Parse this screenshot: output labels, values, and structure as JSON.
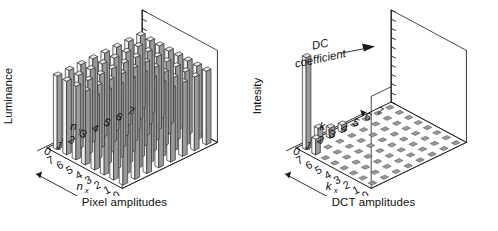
{
  "figure": {
    "title": "",
    "panels": [
      {
        "id": "pixel-amplitudes",
        "caption": "Pixel amplitudes",
        "vertical_axis_label": "Luminance",
        "x_axis_label": "n",
        "x_axis_sub": "x",
        "y_axis_label": "n",
        "y_axis_sub": "y",
        "tick_labels_y": [
          "0",
          "1",
          "2",
          "3",
          "4",
          "5",
          "6",
          "7"
        ],
        "tick_labels_x": [
          "7",
          "6",
          "5",
          "4",
          "3",
          "2",
          "1",
          "0"
        ],
        "annotation": "",
        "annotation_sub": ""
      },
      {
        "id": "dct-amplitudes",
        "caption": "DCT amplitudes",
        "vertical_axis_label": "Intesity",
        "x_axis_label": "k",
        "x_axis_sub": "x",
        "y_axis_label": "k",
        "y_axis_sub": "y",
        "tick_labels_y": [
          "0",
          "1",
          "2",
          "3",
          "4",
          "5",
          "6",
          "7"
        ],
        "tick_labels_x": [
          "7",
          "6",
          "5",
          "4",
          "3",
          "2",
          "1",
          "0"
        ],
        "annotation": "DC",
        "annotation_sub": "coefficient"
      }
    ]
  },
  "colors": {
    "background": "#ffffff",
    "ink": "#111111",
    "bar_top": "#e9e9e9",
    "bar_left": "#f4f4f4",
    "bar_right": "#9a9a9a",
    "bar_edge": "#2b2b2b",
    "floor_tile": "#9a9a9a",
    "floor_tile_edge": "#555555",
    "axis_line": "#1a1a1a",
    "wall_line": "#333333"
  },
  "chart_data": [
    {
      "type": "bar",
      "id": "pixel-amplitudes",
      "title": "Pixel amplitudes",
      "xlabel": "n_x",
      "ylabel": "n_y",
      "zlabel": "Luminance",
      "grid": false,
      "legend": "none",
      "x": [
        0,
        1,
        2,
        3,
        4,
        5,
        6,
        7
      ],
      "y": [
        0,
        1,
        2,
        3,
        4,
        5,
        6,
        7
      ],
      "zlim": [
        0,
        1
      ],
      "note": "8x8 grid of near-uniform tall bars (flat image block); all amplitudes approximately equal",
      "values": [
        [
          0.8,
          0.8,
          0.8,
          0.8,
          0.8,
          0.8,
          0.8,
          0.8
        ],
        [
          0.8,
          0.8,
          0.8,
          0.8,
          0.8,
          0.8,
          0.8,
          0.8
        ],
        [
          0.8,
          0.8,
          0.8,
          0.8,
          0.8,
          0.8,
          0.8,
          0.8
        ],
        [
          0.8,
          0.8,
          0.8,
          0.8,
          0.8,
          0.8,
          0.8,
          0.8
        ],
        [
          0.8,
          0.8,
          0.8,
          0.8,
          0.8,
          0.8,
          0.8,
          0.8
        ],
        [
          0.8,
          0.8,
          0.8,
          0.8,
          0.8,
          0.8,
          0.8,
          0.8
        ],
        [
          0.8,
          0.8,
          0.8,
          0.8,
          0.8,
          0.8,
          0.8,
          0.8
        ],
        [
          0.8,
          0.8,
          0.8,
          0.8,
          0.8,
          0.8,
          0.8,
          0.8
        ]
      ]
    },
    {
      "type": "bar",
      "id": "dct-amplitudes",
      "title": "DCT amplitudes",
      "xlabel": "k_x",
      "ylabel": "k_y",
      "zlabel": "Intesity",
      "grid": true,
      "legend": "none",
      "x": [
        0,
        1,
        2,
        3,
        4,
        5,
        6,
        7
      ],
      "y": [
        0,
        1,
        2,
        3,
        4,
        5,
        6,
        7
      ],
      "zlim": [
        0,
        1
      ],
      "annotations": [
        {
          "text": "DC coefficient",
          "points_to": [
            0,
            0
          ]
        }
      ],
      "note": "Energy concentrated in the DC coefficient at (0,0); a few small low-frequency coefficients; all others zero",
      "values": [
        [
          1.0,
          0.17,
          0.11,
          0.08,
          0.0,
          0.0,
          0.0,
          0.0
        ],
        [
          0.17,
          0.0,
          0.0,
          0.0,
          0.0,
          0.0,
          0.0,
          0.0
        ],
        [
          0.0,
          0.0,
          0.0,
          0.0,
          0.0,
          0.0,
          0.0,
          0.0
        ],
        [
          0.0,
          0.0,
          0.0,
          0.0,
          0.0,
          0.0,
          0.0,
          0.0
        ],
        [
          0.0,
          0.0,
          0.0,
          0.0,
          0.0,
          0.0,
          0.0,
          0.0
        ],
        [
          0.0,
          0.0,
          0.0,
          0.0,
          0.0,
          0.0,
          0.0,
          0.0
        ],
        [
          0.0,
          0.0,
          0.0,
          0.0,
          0.0,
          0.0,
          0.0,
          0.0
        ],
        [
          0.0,
          0.0,
          0.0,
          0.0,
          0.0,
          0.0,
          0.0,
          0.0
        ]
      ]
    }
  ]
}
